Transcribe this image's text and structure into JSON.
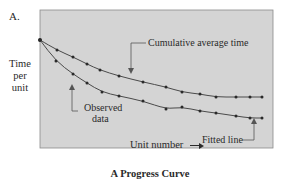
{
  "panel_label": "A.",
  "chart_data": {
    "type": "line",
    "title": "A Progress Curve",
    "xlabel": "Unit number",
    "ylabel": "Time per unit",
    "grid": false,
    "axis_ticks": "none",
    "background_color": "#d6d6d6",
    "series": [
      {
        "name": "Cumulative average time",
        "style": "line+markers",
        "points_px": [
          [
            40,
            40
          ],
          [
            57,
            50
          ],
          [
            73,
            57
          ],
          [
            87,
            64
          ],
          [
            100,
            70
          ],
          [
            119,
            76
          ],
          [
            143,
            82
          ],
          [
            166,
            87
          ],
          [
            182,
            92
          ],
          [
            200,
            94
          ],
          [
            216,
            97
          ],
          [
            236,
            97
          ],
          [
            250,
            97
          ],
          [
            262,
            97
          ]
        ]
      },
      {
        "name": "Observed data / Fitted line",
        "style": "line+markers",
        "points_px": [
          [
            40,
            40
          ],
          [
            56,
            61
          ],
          [
            73,
            74
          ],
          [
            87,
            83
          ],
          [
            102,
            92
          ],
          [
            119,
            96
          ],
          [
            143,
            101
          ],
          [
            166,
            109
          ],
          [
            182,
            107
          ],
          [
            200,
            111
          ],
          [
            216,
            113
          ],
          [
            236,
            116
          ],
          [
            250,
            118
          ],
          [
            262,
            118
          ]
        ]
      }
    ],
    "annotations": [
      {
        "text": "Cumulative average time",
        "target": "upper curve"
      },
      {
        "text": "Observed data",
        "target": "lower curve markers"
      },
      {
        "text": "Fitted line",
        "target": "lower curve line"
      }
    ]
  },
  "labels": {
    "ylabel_lines": [
      "Time",
      "per",
      "unit"
    ],
    "xlabel": "Unit number",
    "title": "A Progress Curve",
    "ann_cumulative": "Cumulative average time",
    "ann_observed_1": "Observed",
    "ann_observed_2": "data",
    "ann_fitted": "Fitted line"
  }
}
